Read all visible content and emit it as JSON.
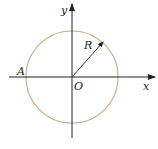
{
  "diagram": {
    "labels": {
      "y_axis": "y",
      "x_axis": "x",
      "origin": "O",
      "radius": "R",
      "point_a": "A"
    },
    "colors": {
      "circle": "#c8a88c",
      "axes": "#222222"
    }
  }
}
